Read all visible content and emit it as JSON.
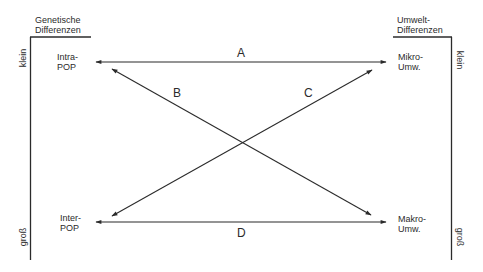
{
  "diagram": {
    "left_axis": {
      "header_line1": "Genetische",
      "header_line2": "Differenzen",
      "top_label": "klein",
      "bottom_label": "groß"
    },
    "right_axis": {
      "header_line1": "Umwelt-",
      "header_line2": "Differenzen",
      "top_label": "klein",
      "bottom_label": "groß"
    },
    "nodes": {
      "top_left": {
        "line1": "Intra-",
        "line2": "POP"
      },
      "bottom_left": {
        "line1": "Inter-",
        "line2": "POP"
      },
      "top_right": {
        "line1": "Mikro-",
        "line2": "Umw."
      },
      "bottom_right": {
        "line1": "Makro-",
        "line2": "Umw."
      }
    },
    "edges": [
      {
        "label": "A",
        "from": "Intra-POP",
        "to": "Mikro-Umw.",
        "direction": "bidirectional"
      },
      {
        "label": "B",
        "from": "Intra-POP",
        "to": "Makro-Umw.",
        "direction": "bidirectional"
      },
      {
        "label": "C",
        "from": "Inter-POP",
        "to": "Mikro-Umw.",
        "direction": "bidirectional"
      },
      {
        "label": "D",
        "from": "Inter-POP",
        "to": "Makro-Umw.",
        "direction": "bidirectional"
      }
    ],
    "colors": {
      "ink": "#2b2b2b",
      "background": "#ffffff"
    }
  }
}
